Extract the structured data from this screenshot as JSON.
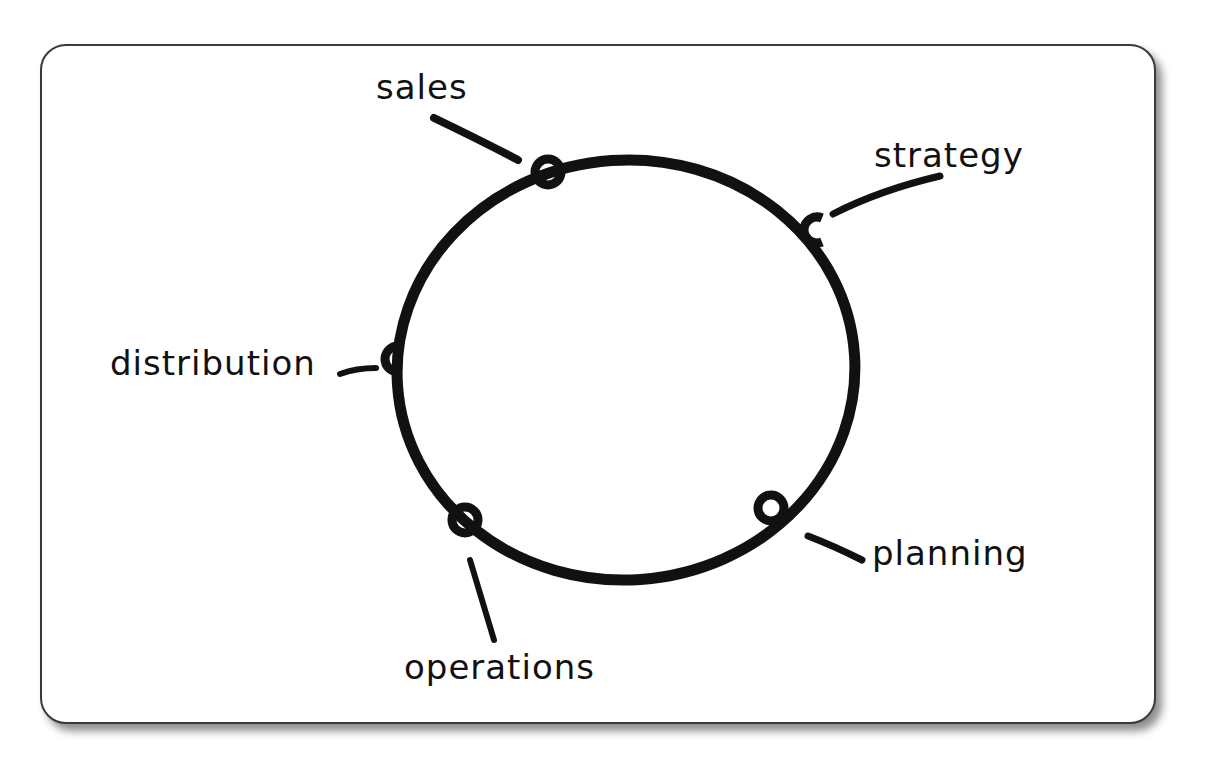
{
  "diagram": {
    "type": "cycle",
    "style": "hand-drawn",
    "colors": {
      "ink": "#111111",
      "card_border": "#3a3a3a",
      "background": "#ffffff"
    },
    "nodes": [
      {
        "id": "sales",
        "label": "sales"
      },
      {
        "id": "strategy",
        "label": "strategy"
      },
      {
        "id": "planning",
        "label": "planning"
      },
      {
        "id": "operations",
        "label": "operations"
      },
      {
        "id": "distribution",
        "label": "distribution"
      }
    ]
  }
}
